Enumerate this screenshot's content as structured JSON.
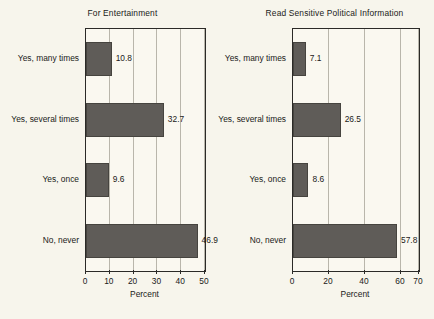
{
  "figure": {
    "background_color": "#f7f5ec",
    "bar_color": "#5f5c58",
    "axis_color": "#2b2a27",
    "grid_color": "#b9b6ab"
  },
  "chart_data": [
    {
      "type": "bar",
      "orientation": "horizontal",
      "title": "For Entertainment",
      "xlabel": "Percent",
      "ylabel": "",
      "categories": [
        "Yes, many times",
        "Yes, several times",
        "Yes, once",
        "No, never"
      ],
      "values": [
        10.8,
        32.7,
        9.6,
        46.9
      ],
      "value_labels": [
        "10.8",
        "32.7",
        "9.6",
        "46.9"
      ],
      "xlim": [
        0,
        50
      ],
      "xticks": [
        0,
        10,
        20,
        30,
        40,
        50
      ],
      "xtick_labels": [
        "0",
        "10",
        "20",
        "30",
        "40",
        "50"
      ],
      "grid": true,
      "legend": false
    },
    {
      "type": "bar",
      "orientation": "horizontal",
      "title": "Read Sensitive Political Information",
      "xlabel": "Percent",
      "ylabel": "",
      "categories": [
        "Yes, many times",
        "Yes, several times",
        "Yes, once",
        "No, never"
      ],
      "values": [
        7.1,
        26.5,
        8.6,
        57.8
      ],
      "value_labels": [
        "7.1",
        "26.5",
        "8.6",
        "57.8"
      ],
      "xlim": [
        0,
        70
      ],
      "xticks": [
        0,
        20,
        40,
        60,
        70
      ],
      "xtick_labels": [
        "0",
        "20",
        "40",
        "60",
        "70"
      ],
      "grid": true,
      "legend": false
    }
  ]
}
